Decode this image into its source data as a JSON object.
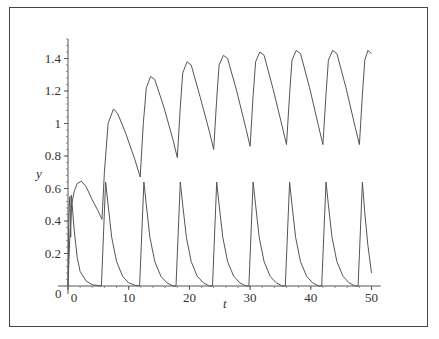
{
  "chart_data": {
    "type": "line",
    "title": "",
    "xlabel": "t",
    "ylabel": "y",
    "xlim": [
      -1,
      51.5
    ],
    "ylim": [
      0,
      1.52
    ],
    "grid": false,
    "legend": null,
    "x_ticks": [
      0,
      10,
      20,
      30,
      40,
      50
    ],
    "y_ticks": [
      0.2,
      0.4,
      0.6,
      0.8,
      1,
      1.2,
      1.4
    ],
    "y_tick_labels": [
      "0.2",
      "0.4",
      "0.6",
      "0.8",
      "1",
      "1.2",
      "1.4"
    ],
    "x_tick_labels": [
      "0",
      "10",
      "20",
      "30",
      "40",
      "50"
    ],
    "origin_label": "0",
    "series": [
      {
        "name": "upper-curve",
        "color": "#555555",
        "points": [
          [
            0,
            0.0
          ],
          [
            0.3,
            0.3
          ],
          [
            0.6,
            0.5
          ],
          [
            1.0,
            0.58
          ],
          [
            1.5,
            0.63
          ],
          [
            2.2,
            0.645
          ],
          [
            3.0,
            0.61
          ],
          [
            4.0,
            0.53
          ],
          [
            5.0,
            0.46
          ],
          [
            5.6,
            0.41
          ],
          [
            6.0,
            0.7
          ],
          [
            6.6,
            1.0
          ],
          [
            7.5,
            1.09
          ],
          [
            8.2,
            1.06
          ],
          [
            9.5,
            0.94
          ],
          [
            11.0,
            0.78
          ],
          [
            11.9,
            0.67
          ],
          [
            12.4,
            1.0
          ],
          [
            12.9,
            1.22
          ],
          [
            13.6,
            1.29
          ],
          [
            14.3,
            1.27
          ],
          [
            15.8,
            1.1
          ],
          [
            17.3,
            0.9
          ],
          [
            18.0,
            0.79
          ],
          [
            18.5,
            1.1
          ],
          [
            18.9,
            1.31
          ],
          [
            19.6,
            1.38
          ],
          [
            20.3,
            1.36
          ],
          [
            21.8,
            1.16
          ],
          [
            23.3,
            0.95
          ],
          [
            24.0,
            0.84
          ],
          [
            24.5,
            1.15
          ],
          [
            24.9,
            1.36
          ],
          [
            25.6,
            1.42
          ],
          [
            26.3,
            1.4
          ],
          [
            27.8,
            1.2
          ],
          [
            29.3,
            0.97
          ],
          [
            30.0,
            0.86
          ],
          [
            30.5,
            1.17
          ],
          [
            30.9,
            1.38
          ],
          [
            31.6,
            1.44
          ],
          [
            32.3,
            1.42
          ],
          [
            33.8,
            1.21
          ],
          [
            35.3,
            0.98
          ],
          [
            36.0,
            0.87
          ],
          [
            36.5,
            1.18
          ],
          [
            36.9,
            1.39
          ],
          [
            37.6,
            1.45
          ],
          [
            38.3,
            1.43
          ],
          [
            39.8,
            1.22
          ],
          [
            41.3,
            0.98
          ],
          [
            42.0,
            0.87
          ],
          [
            42.5,
            1.18
          ],
          [
            42.9,
            1.39
          ],
          [
            43.6,
            1.45
          ],
          [
            44.3,
            1.43
          ],
          [
            45.8,
            1.22
          ],
          [
            47.3,
            0.98
          ],
          [
            48.0,
            0.87
          ],
          [
            48.5,
            1.18
          ],
          [
            48.9,
            1.39
          ],
          [
            49.4,
            1.45
          ],
          [
            50.0,
            1.43
          ]
        ]
      },
      {
        "name": "lower-curve",
        "color": "#555555",
        "points": [
          [
            0,
            0.0
          ],
          [
            0.15,
            0.45
          ],
          [
            0.3,
            0.55
          ],
          [
            0.45,
            0.3
          ],
          [
            0.55,
            0.56
          ],
          [
            0.7,
            0.5
          ],
          [
            1.0,
            0.35
          ],
          [
            1.5,
            0.18
          ],
          [
            2.0,
            0.09
          ],
          [
            3.0,
            0.03
          ],
          [
            4.0,
            0.008
          ],
          [
            5.5,
            0.0
          ],
          [
            6.2,
            0.64
          ],
          [
            6.6,
            0.5
          ],
          [
            7.2,
            0.3
          ],
          [
            8.0,
            0.15
          ],
          [
            9.0,
            0.06
          ],
          [
            10.0,
            0.02
          ],
          [
            11.0,
            0.005
          ],
          [
            11.8,
            0.0
          ],
          [
            12.5,
            0.64
          ],
          [
            12.9,
            0.5
          ],
          [
            13.5,
            0.3
          ],
          [
            14.3,
            0.15
          ],
          [
            15.3,
            0.06
          ],
          [
            16.3,
            0.02
          ],
          [
            17.3,
            0.0
          ],
          [
            17.8,
            0.0
          ],
          [
            18.5,
            0.64
          ],
          [
            18.9,
            0.5
          ],
          [
            19.5,
            0.3
          ],
          [
            20.3,
            0.15
          ],
          [
            21.3,
            0.06
          ],
          [
            22.3,
            0.02
          ],
          [
            23.3,
            0.0
          ],
          [
            23.8,
            0.0
          ],
          [
            24.5,
            0.64
          ],
          [
            24.9,
            0.5
          ],
          [
            25.5,
            0.3
          ],
          [
            26.3,
            0.15
          ],
          [
            27.3,
            0.06
          ],
          [
            28.3,
            0.02
          ],
          [
            29.3,
            0.0
          ],
          [
            29.8,
            0.0
          ],
          [
            30.5,
            0.64
          ],
          [
            30.9,
            0.5
          ],
          [
            31.5,
            0.3
          ],
          [
            32.3,
            0.15
          ],
          [
            33.3,
            0.06
          ],
          [
            34.3,
            0.02
          ],
          [
            35.3,
            0.0
          ],
          [
            35.8,
            0.0
          ],
          [
            36.5,
            0.64
          ],
          [
            36.9,
            0.5
          ],
          [
            37.5,
            0.3
          ],
          [
            38.3,
            0.15
          ],
          [
            39.3,
            0.06
          ],
          [
            40.3,
            0.02
          ],
          [
            41.3,
            0.0
          ],
          [
            41.8,
            0.0
          ],
          [
            42.5,
            0.64
          ],
          [
            42.9,
            0.5
          ],
          [
            43.5,
            0.3
          ],
          [
            44.3,
            0.15
          ],
          [
            45.3,
            0.06
          ],
          [
            46.3,
            0.02
          ],
          [
            47.3,
            0.0
          ],
          [
            47.8,
            0.0
          ],
          [
            48.5,
            0.64
          ],
          [
            48.9,
            0.45
          ],
          [
            49.4,
            0.25
          ],
          [
            50.0,
            0.08
          ]
        ]
      }
    ]
  },
  "layout": {
    "plot_origin_px": [
      68,
      286
    ],
    "px_per_t": 6.07,
    "px_per_y": 162.5
  }
}
